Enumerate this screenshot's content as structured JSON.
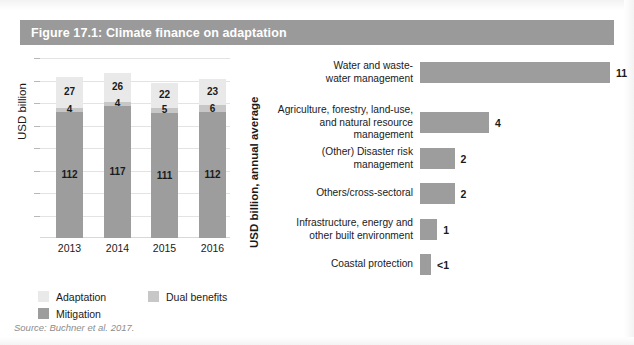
{
  "figure": {
    "title": "Figure 17.1: Climate finance on adaptation",
    "title_bar_color": "#9a9a9a",
    "source": "Source: Buchner et al. 2017."
  },
  "legend": {
    "items": [
      {
        "label": "Adaptation",
        "color": "#e9e9e9"
      },
      {
        "label": "Dual benefits",
        "color": "#c7c7c7"
      },
      {
        "label": "Mitigation",
        "color": "#9d9d9d"
      }
    ]
  },
  "chart_data": [
    {
      "type": "bar",
      "id": "stacked-finance-by-year",
      "orientation": "vertical",
      "stacked": true,
      "title": "",
      "xlabel": "",
      "ylabel": "USD billion",
      "categories": [
        "2013",
        "2014",
        "2015",
        "2016"
      ],
      "ylim": [
        0,
        160
      ],
      "grid": true,
      "legend_position": "bottom-left",
      "series": [
        {
          "name": "Mitigation",
          "color": "#9d9d9d",
          "values": [
            112,
            117,
            111,
            112
          ]
        },
        {
          "name": "Dual benefits",
          "color": "#c7c7c7",
          "values": [
            4,
            4,
            5,
            6
          ]
        },
        {
          "name": "Adaptation",
          "color": "#e9e9e9",
          "values": [
            27,
            26,
            22,
            23
          ]
        }
      ],
      "totals": [
        143,
        147,
        138,
        141
      ]
    },
    {
      "type": "bar",
      "id": "adaptation-finance-by-sector",
      "orientation": "horizontal",
      "stacked": false,
      "title": "",
      "xlabel": "",
      "ylabel": "USD billion, annual average",
      "bar_color": "#9d9d9d",
      "grid": false,
      "categories": [
        "Water and waste-\nwater management",
        "Agriculture, forestry, land-use,\nand natural resource management",
        "(Other) Disaster risk management",
        "Others/cross-sectoral",
        "Infrastructure, energy and\nother built environment",
        "Coastal protection"
      ],
      "values": [
        11,
        4,
        2,
        2,
        1,
        0.5
      ],
      "value_labels": [
        "11",
        "4",
        "2",
        "2",
        "1",
        "<1"
      ],
      "xlim": [
        0,
        11
      ]
    }
  ]
}
